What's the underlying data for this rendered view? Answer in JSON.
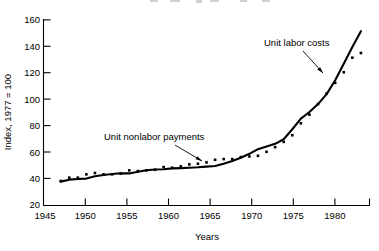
{
  "chart_data": {
    "type": "line",
    "title": "",
    "xlabel": "Years",
    "ylabel": "Index, 1977 = 100",
    "xlim": [
      1945,
      1983
    ],
    "ylim": [
      20,
      160
    ],
    "grid": false,
    "legend_position": "inline-annotations",
    "xticks": [
      1945,
      1950,
      1955,
      1960,
      1965,
      1970,
      1975,
      1980
    ],
    "yticks": [
      20,
      40,
      60,
      80,
      100,
      120,
      140,
      160
    ],
    "annotations": [
      {
        "text": "Unit labor costs",
        "series": "Unit labor costs"
      },
      {
        "text": "Unit nonlabor payments",
        "series": "Unit nonlabor payments"
      }
    ],
    "series": [
      {
        "name": "Unit labor costs",
        "style": "solid",
        "x": [
          1947,
          1948,
          1949,
          1950,
          1951,
          1952,
          1953,
          1954,
          1955,
          1956,
          1957,
          1958,
          1959,
          1960,
          1961,
          1962,
          1963,
          1964,
          1965,
          1966,
          1967,
          1968,
          1969,
          1970,
          1971,
          1972,
          1973,
          1974,
          1975,
          1976,
          1977,
          1978,
          1979,
          1980,
          1981,
          1982
        ],
        "y": [
          38.0,
          39.5,
          40.0,
          40.3,
          42.0,
          43.0,
          43.8,
          44.3,
          44.2,
          45.5,
          46.6,
          47.2,
          47.3,
          48.0,
          48.2,
          48.5,
          48.8,
          49.3,
          49.8,
          51.5,
          53.5,
          56.0,
          59.0,
          62.5,
          64.5,
          66.5,
          70.0,
          77.5,
          85.5,
          90.5,
          96.5,
          104.0,
          114.5,
          127.0,
          139.5,
          151.5
        ]
      },
      {
        "name": "Unit nonlabor payments",
        "style": "dotted",
        "x": [
          1947,
          1948,
          1949,
          1950,
          1951,
          1952,
          1953,
          1954,
          1955,
          1956,
          1957,
          1958,
          1959,
          1960,
          1961,
          1962,
          1963,
          1964,
          1965,
          1966,
          1967,
          1968,
          1969,
          1970,
          1971,
          1972,
          1973,
          1974,
          1975,
          1976,
          1977,
          1978,
          1979,
          1980,
          1981,
          1982
        ],
        "y": [
          38.5,
          41.0,
          41.0,
          43.5,
          44.5,
          43.5,
          43.5,
          44.0,
          46.5,
          46.0,
          46.5,
          47.0,
          49.0,
          48.5,
          49.5,
          51.0,
          51.5,
          52.5,
          54.5,
          55.0,
          55.0,
          56.5,
          57.0,
          57.5,
          60.5,
          64.0,
          68.0,
          73.0,
          82.0,
          88.5,
          96.5,
          104.5,
          112.5,
          120.5,
          131.5,
          135.0
        ]
      }
    ]
  },
  "labels": {
    "unit_labor_costs": "Unit labor costs",
    "unit_nonlabor_payments": "Unit nonlabor payments",
    "x_axis_title": "Years",
    "y_axis_title": "Index, 1977 = 100"
  },
  "colors": {
    "ink": "#000000",
    "background": "#ffffff"
  }
}
